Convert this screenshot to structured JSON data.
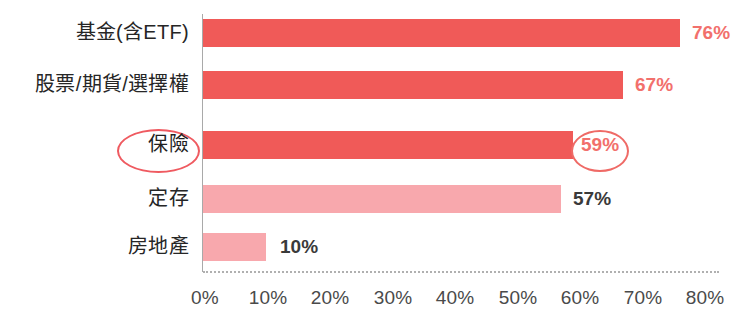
{
  "chart_data": {
    "type": "bar",
    "orientation": "horizontal",
    "title": "",
    "subtitle": "",
    "xlabel": "",
    "ylabel": "",
    "categories": [
      "基金(含ETF)",
      "股票/期貨/選擇權",
      "保險",
      "定存",
      "房地產"
    ],
    "values": [
      76,
      67,
      59,
      57,
      10
    ],
    "value_labels": [
      "76%",
      "67%",
      "59%",
      "57%",
      "10%"
    ],
    "xlim": [
      0,
      80
    ],
    "xticks": [
      0,
      10,
      20,
      30,
      40,
      50,
      60,
      70,
      80
    ],
    "xtick_labels": [
      "0%",
      "10%",
      "20%",
      "30%",
      "40%",
      "50%",
      "60%",
      "70%",
      "80%"
    ],
    "grid": false,
    "legend": null,
    "bar_colors": [
      "#f05a58",
      "#f05a58",
      "#f05a58",
      "#f8a8ad",
      "#f8a8ad"
    ],
    "value_label_colors": [
      "#f2706c",
      "#f2706c",
      "#f2706c",
      "#3a3a3a",
      "#3a3a3a"
    ],
    "highlighted_category": "保險",
    "annotations": [
      {
        "name": "ellipse-around-category-label",
        "target": "保險",
        "color": "#ef5a60"
      },
      {
        "name": "ellipse-around-value-label",
        "target": "59%",
        "color": "#ef6a66"
      }
    ]
  },
  "axis": {
    "tick_0": "0%",
    "tick_1": "10%",
    "tick_2": "20%",
    "tick_3": "30%",
    "tick_4": "40%",
    "tick_5": "50%",
    "tick_6": "60%",
    "tick_7": "70%",
    "tick_8": "80%"
  },
  "rows": [
    {
      "label": "基金(含ETF)",
      "value_label": "76%"
    },
    {
      "label": "股票/期貨/選擇權",
      "value_label": "67%"
    },
    {
      "label": "保險",
      "value_label": "59%"
    },
    {
      "label": "定存",
      "value_label": "57%"
    },
    {
      "label": "房地產",
      "value_label": "10%"
    }
  ],
  "colors": {
    "bar_dark": "#f05a58",
    "bar_light": "#f8a8ad",
    "value_red": "#f2706c",
    "value_dark": "#3a3a3a",
    "highlight_ring": "#ef5a60",
    "axis_line": "#a9a9a9"
  }
}
